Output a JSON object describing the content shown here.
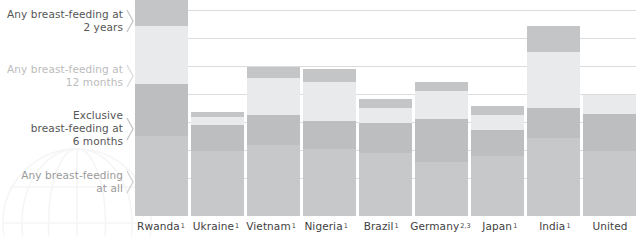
{
  "chart_data": {
    "type": "bar",
    "subtype": "stacked-bar",
    "title": "",
    "xlabel": "",
    "ylabel": "",
    "ylim": [
      0,
      100
    ],
    "grid": true,
    "gridline_count": 7,
    "legend_position": "left",
    "categories": [
      "Rwanda",
      "Ukraine",
      "Vietnam",
      "Nigeria",
      "Brazil",
      "Germany",
      "Japan",
      "India",
      "United"
    ],
    "category_superscripts": [
      "1",
      "1",
      "1",
      "1",
      "1",
      "2,3",
      "1",
      "1",
      ""
    ],
    "series": [
      {
        "name": "Any breast-feeding at all",
        "color": "#c6c8ca",
        "values": [
          37,
          30,
          33,
          31,
          29,
          25,
          28,
          36,
          30
        ]
      },
      {
        "name": "Exclusive breast-feeding at 6 months",
        "color": "#bcbec0",
        "values": [
          24,
          12,
          14,
          13,
          14,
          20,
          12,
          14,
          17
        ]
      },
      {
        "name": "Any breast-feeding at 12 months",
        "color": "#e9eaeb",
        "values": [
          27,
          4,
          17,
          18,
          7,
          13,
          7,
          26,
          9
        ]
      },
      {
        "name": "Any breast-feeding at 2 years",
        "color": "#c3c5c7",
        "values": [
          12,
          2,
          5,
          6,
          4,
          4,
          4,
          12,
          0
        ]
      }
    ],
    "bar_totals": [
      100,
      48,
      69,
      68,
      54,
      62,
      51,
      88,
      56
    ],
    "annotations": []
  },
  "legend": {
    "items": [
      {
        "lines": [
          "Any breast-feeding at",
          "2 years"
        ],
        "color": "#565656",
        "marker": "chevron-right-icon"
      },
      {
        "lines": [
          "Any breast-feeding at",
          "12 months"
        ],
        "color": "#bcbcbc",
        "marker": "chevron-right-icon"
      },
      {
        "lines": [
          "Exclusive",
          "breast-feeding at",
          "6 months"
        ],
        "color": "#565656",
        "marker": "chevron-right-icon"
      },
      {
        "lines": [
          "Any breast-feeding",
          "at all"
        ],
        "color": "#9a9a9a",
        "marker": "chevron-right-icon"
      }
    ]
  },
  "watermark": {
    "name": "globe-graphic"
  },
  "colors": {
    "gridline": "#dcdcdc",
    "background": "#ffffff",
    "axis_label": "#3f3f3f"
  }
}
